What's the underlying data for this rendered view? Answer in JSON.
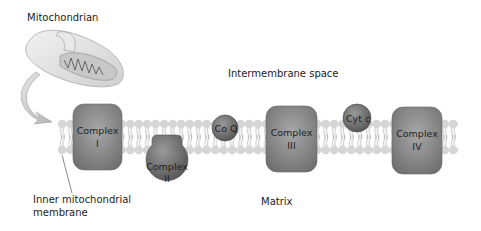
{
  "labels": {
    "mitochondrion": "Mitochondrian",
    "intermembrane_space": "Intermembrane space",
    "matrix": "Matrix",
    "inner_membrane_line1": "Inner mitochondrial",
    "inner_membrane_line2": "membrane"
  },
  "complexes": [
    {
      "name": "Complex",
      "numeral": "I"
    },
    {
      "name": "Complex",
      "numeral": "II"
    },
    {
      "name": "Complex",
      "numeral": "III"
    },
    {
      "name": "Complex",
      "numeral": "IV"
    }
  ],
  "carriers": [
    {
      "label": "Co Q"
    },
    {
      "label": "Cyt c"
    }
  ],
  "colors": {
    "protein": "#8a8a8a",
    "lipid_head": "#d4d4d4",
    "arrow": "#cfcfcf"
  }
}
